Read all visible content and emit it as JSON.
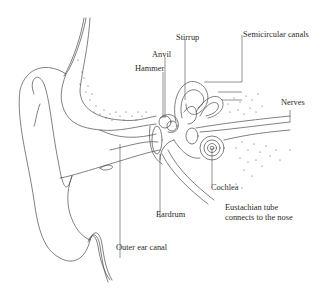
{
  "diagram": {
    "labels": {
      "stirrup": "Stirrup",
      "anvil": "Anvil",
      "hammer": "Hammer",
      "semicircular_canals": "Semicircular canals",
      "nerves": "Nerves",
      "cochlea": "Cochlea",
      "eustachian_tube_line1": "Eustachian tube",
      "eustachian_tube_line2": "connects to the nose",
      "eardrum": "Eardrum",
      "outer_ear_canal": "Outer ear canal"
    },
    "colors": {
      "line": "#4a4a4a",
      "text": "#2b2b2b",
      "background": "#ffffff"
    }
  }
}
